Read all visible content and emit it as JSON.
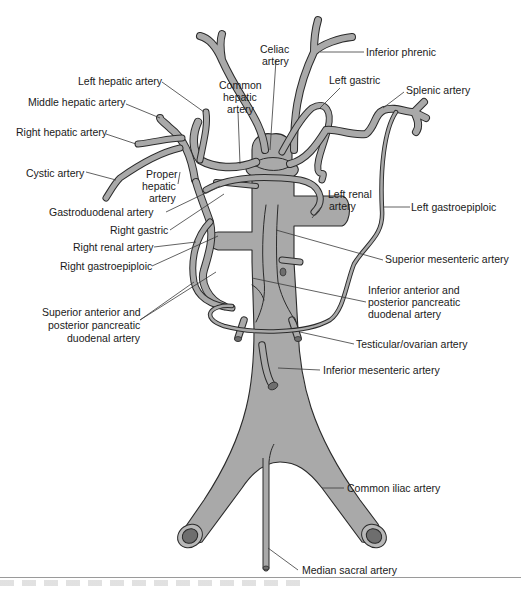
{
  "figure": {
    "colors": {
      "vessel_fill": "#a9a9a9",
      "outline": "#2a2a2a",
      "lumen": "#6e6e6e",
      "text": "#1a1a1a",
      "background": "#ffffff"
    }
  },
  "labels": {
    "celiac_artery": [
      "Celiac",
      "artery"
    ],
    "inferior_phrenic": "Inferior phrenic",
    "left_hepatic_artery": "Left hepatic artery",
    "common_hepatic_artery": [
      "Common",
      "hepatic",
      "artery"
    ],
    "left_gastric": "Left gastric",
    "splenic_artery": "Splenic artery",
    "middle_hepatic_artery": "Middle hepatic artery",
    "right_hepatic_artery": "Right hepatic artery",
    "cystic_artery": "Cystic artery",
    "proper_hepatic_artery": [
      "Proper",
      "hepatic",
      "artery"
    ],
    "left_renal_artery": [
      "Left renal",
      "artery"
    ],
    "left_gastroepiploic": "Left gastroepiploic",
    "gastroduodenal_artery": "Gastroduodenal artery",
    "right_gastric": "Right gastric",
    "right_renal_artery": "Right renal artery",
    "right_gastroepiploic": "Right gastroepiploic",
    "superior_mesenteric_artery": "Superior mesenteric artery",
    "inferior_pancreatic_duodenal": [
      "Inferior anterior and",
      "posterior pancreatic",
      "duodenal artery"
    ],
    "superior_pancreatic_duodenal": [
      "Superior anterior and",
      "posterior pancreatic",
      "duodenal artery"
    ],
    "testicular_ovarian_artery": "Testicular/ovarian artery",
    "inferior_mesenteric_artery": "Inferior mesenteric artery",
    "common_iliac_artery": "Common iliac artery",
    "median_sacral_artery": "Median sacral artery"
  }
}
